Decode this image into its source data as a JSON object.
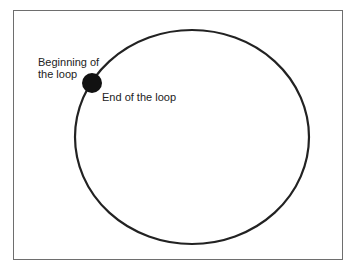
{
  "diagram": {
    "labels": {
      "beginning": "Beginning of the loop",
      "beginning_line1": "Beginning of",
      "beginning_line2": "the loop",
      "end": "End of the loop"
    },
    "shapes": {
      "loop": {
        "type": "ellipse",
        "cx": 192,
        "cy": 137,
        "rx": 117,
        "ry": 107,
        "stroke": "#222222"
      },
      "marker": {
        "type": "circle",
        "cx": 92,
        "cy": 83,
        "r": 10,
        "fill": "#111111"
      }
    },
    "colors": {
      "frame": "#6e6e6e",
      "background": "#ffffff"
    }
  }
}
